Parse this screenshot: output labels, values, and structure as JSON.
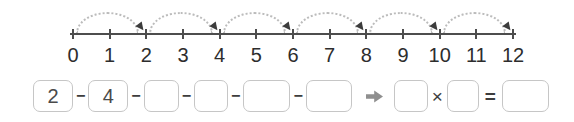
{
  "number_line": {
    "tick_labels": [
      "0",
      "1",
      "2",
      "3",
      "4",
      "5",
      "6",
      "7",
      "8",
      "9",
      "10",
      "11",
      "12"
    ],
    "jumps": [
      {
        "from": 0,
        "to": 2
      },
      {
        "from": 2,
        "to": 4
      },
      {
        "from": 4,
        "to": 6
      },
      {
        "from": 6,
        "to": 8
      },
      {
        "from": 8,
        "to": 10
      },
      {
        "from": 10,
        "to": 12
      }
    ],
    "colors": {
      "axis": "#4d4d4d",
      "arc_dots": "#bcbcbc",
      "labels": "#2d2d2d",
      "arrowhead": "#3c3c3c"
    }
  },
  "equation_row": {
    "separator": "−",
    "sequence_boxes": [
      {
        "value": "2"
      },
      {
        "value": "4"
      },
      {
        "value": ""
      },
      {
        "value": ""
      },
      {
        "value": ""
      },
      {
        "value": ""
      }
    ],
    "arrow_icon": "right-arrow",
    "times_symbol": "×",
    "equals_symbol": "=",
    "factor_boxes": [
      {
        "value": ""
      },
      {
        "value": ""
      }
    ],
    "result_box": {
      "value": ""
    },
    "colors": {
      "box_border": "#c6c6c6",
      "digits": "#4a4a4a",
      "operators": "#3d3d3d",
      "arrow": "#8f8f8f"
    }
  }
}
